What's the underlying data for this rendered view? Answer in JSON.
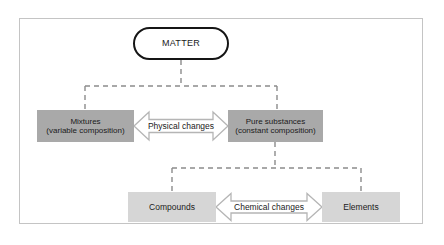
{
  "diagram": {
    "root": {
      "id": "matter",
      "label": "MATTER",
      "shape": "stadium",
      "fill": "#ffffff",
      "border": "#151515"
    },
    "level_one": [
      {
        "id": "mixtures",
        "label_line1": "Mixtures",
        "label_line2": "(variable composition)",
        "shape": "rectangle",
        "fill": "#a9a9a9"
      },
      {
        "id": "pure-substances",
        "label_line1": "Pure substances",
        "label_line2": "(constant composition)",
        "shape": "rectangle",
        "fill": "#a9a9a9"
      }
    ],
    "level_two": [
      {
        "id": "compounds",
        "label_line1": "Compounds",
        "label_line2": "",
        "shape": "rectangle",
        "fill": "#d6d6d6"
      },
      {
        "id": "elements",
        "label_line1": "Elements",
        "label_line2": "",
        "shape": "rectangle",
        "fill": "#d6d6d6"
      }
    ],
    "arrows": [
      {
        "id": "physical-changes",
        "label": "Physical changes",
        "style": "double-headed-hollow",
        "fill": "#ffffff",
        "stroke": "#b5b5b5",
        "connects": [
          "mixtures",
          "pure-substances"
        ]
      },
      {
        "id": "chemical-changes",
        "label": "Chemical changes",
        "style": "double-headed-hollow",
        "fill": "#ffffff",
        "stroke": "#b5b5b5",
        "connects": [
          "compounds",
          "elements"
        ]
      }
    ],
    "connectors": {
      "style": "dashed",
      "color": "#8c8c8c",
      "branches": [
        {
          "from": "matter",
          "to": [
            "mixtures",
            "pure-substances"
          ]
        },
        {
          "from": "pure-substances",
          "to": [
            "compounds",
            "elements"
          ]
        }
      ]
    },
    "frame": {
      "border_color": "#c4c4c4",
      "background": "#ffffff"
    }
  }
}
